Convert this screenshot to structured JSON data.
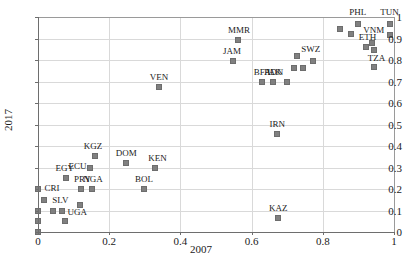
{
  "chart_data": {
    "type": "scatter",
    "title": "",
    "xlabel": "2007",
    "ylabel": "2017",
    "xlim": [
      0,
      1
    ],
    "ylim": [
      0,
      1
    ],
    "grid": true,
    "legend": false,
    "xticks": [
      "0",
      "0.2",
      "0.4",
      "0.6",
      "0.8",
      "1"
    ],
    "xtick_values": [
      0,
      0.2,
      0.4,
      0.6,
      0.8,
      1
    ],
    "yticks": [
      "0",
      "0.1",
      "0.2",
      "0.3",
      "0.4",
      "0.5",
      "0.6",
      "0.7",
      "0.8",
      "0.9",
      "1"
    ],
    "ytick_values": [
      0,
      0.1,
      0.2,
      0.3,
      0.4,
      0.5,
      0.6,
      0.7,
      0.8,
      0.9,
      1
    ],
    "points": [
      {
        "label": "",
        "x": 0.0,
        "y": 0.0,
        "lx": 0,
        "ly": 0
      },
      {
        "label": "",
        "x": 0.0,
        "y": 0.05,
        "lx": 0,
        "ly": 0
      },
      {
        "label": "",
        "x": 0.0,
        "y": 0.1,
        "lx": 0,
        "ly": 0
      },
      {
        "label": "CRI",
        "x": 0.0,
        "y": 0.2,
        "lx": 14,
        "ly": -1
      },
      {
        "label": "SLV",
        "x": 0.018,
        "y": 0.15,
        "lx": 16,
        "ly": 0
      },
      {
        "label": "",
        "x": 0.042,
        "y": 0.1,
        "lx": 0,
        "ly": 0
      },
      {
        "label": "UGA",
        "x": 0.068,
        "y": 0.1,
        "lx": 15,
        "ly": 1
      },
      {
        "label": "",
        "x": 0.075,
        "y": 0.05,
        "lx": 0,
        "ly": 0
      },
      {
        "label": "EGY",
        "x": 0.078,
        "y": 0.25,
        "lx": -1,
        "ly": -10
      },
      {
        "label": "",
        "x": 0.118,
        "y": 0.125,
        "lx": 0,
        "ly": 0
      },
      {
        "label": "PRY",
        "x": 0.122,
        "y": 0.2,
        "lx": 1,
        "ly": -10
      },
      {
        "label": "ECU",
        "x": 0.145,
        "y": 0.3,
        "lx": -12,
        "ly": -2
      },
      {
        "label": "NGA",
        "x": 0.152,
        "y": 0.2,
        "lx": 1,
        "ly": -10
      },
      {
        "label": "KGZ",
        "x": 0.16,
        "y": 0.355,
        "lx": -2,
        "ly": -10
      },
      {
        "label": "DOM",
        "x": 0.248,
        "y": 0.322,
        "lx": 0,
        "ly": -10
      },
      {
        "label": "BOL",
        "x": 0.298,
        "y": 0.2,
        "lx": 0,
        "ly": -10
      },
      {
        "label": "KEN",
        "x": 0.33,
        "y": 0.3,
        "lx": 2,
        "ly": -10
      },
      {
        "label": "VEN",
        "x": 0.34,
        "y": 0.675,
        "lx": 0,
        "ly": -10
      },
      {
        "label": "JAM",
        "x": 0.548,
        "y": 0.795,
        "lx": -1,
        "ly": -10
      },
      {
        "label": "MMR",
        "x": 0.562,
        "y": 0.895,
        "lx": 1,
        "ly": -10
      },
      {
        "label": "BFA",
        "x": 0.63,
        "y": 0.697,
        "lx": 0,
        "ly": -10
      },
      {
        "label": "PAK",
        "x": 0.66,
        "y": 0.697,
        "lx": 0,
        "ly": -10
      },
      {
        "label": "IRN",
        "x": 0.672,
        "y": 0.455,
        "lx": 0,
        "ly": -10
      },
      {
        "label": "KAZ",
        "x": 0.675,
        "y": 0.065,
        "lx": 0,
        "ly": -10
      },
      {
        "label": "IDN",
        "x": 0.7,
        "y": 0.697,
        "lx": -12,
        "ly": -10
      },
      {
        "label": "",
        "x": 0.718,
        "y": 0.765,
        "lx": 0,
        "ly": 0
      },
      {
        "label": "",
        "x": 0.728,
        "y": 0.818,
        "lx": 0,
        "ly": 0
      },
      {
        "label": "",
        "x": 0.745,
        "y": 0.765,
        "lx": 0,
        "ly": 0
      },
      {
        "label": "SWZ",
        "x": 0.772,
        "y": 0.795,
        "lx": -2,
        "ly": -12
      },
      {
        "label": "",
        "x": 0.848,
        "y": 0.942,
        "lx": 0,
        "ly": 0
      },
      {
        "label": "PHL",
        "x": 0.898,
        "y": 0.968,
        "lx": 0,
        "ly": -12
      },
      {
        "label": "",
        "x": 0.88,
        "y": 0.92,
        "lx": 0,
        "ly": 0
      },
      {
        "label": "ETH",
        "x": 0.92,
        "y": 0.86,
        "lx": 2,
        "ly": -10
      },
      {
        "label": "",
        "x": 0.938,
        "y": 0.878,
        "lx": 0,
        "ly": 0
      },
      {
        "label": "",
        "x": 0.945,
        "y": 0.845,
        "lx": 0,
        "ly": 0
      },
      {
        "label": "TZA",
        "x": 0.945,
        "y": 0.768,
        "lx": 2,
        "ly": -9
      },
      {
        "label": "VNM",
        "x": 0.988,
        "y": 0.918,
        "lx": -16,
        "ly": -5
      },
      {
        "label": "TUN",
        "x": 0.99,
        "y": 0.968,
        "lx": -1,
        "ly": -12
      }
    ]
  }
}
